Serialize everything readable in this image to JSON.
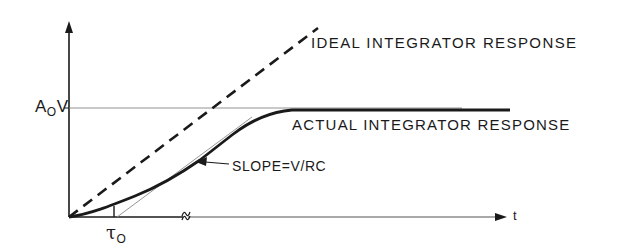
{
  "diagram": {
    "type": "integrator response time plot",
    "curves": {
      "ideal": {
        "label": "IDEAL INTEGRATOR RESPONSE",
        "style": "dashed"
      },
      "actual": {
        "label": "ACTUAL INTEGRATOR RESPONSE",
        "style": "solid"
      }
    },
    "annotations": {
      "slope": "SLOPE=V/RC",
      "saturation_level": {
        "main": "A",
        "sub": "O",
        "tail": "V"
      },
      "time_constant": {
        "main": "τ",
        "sub": "O"
      },
      "time_axis": "t"
    },
    "colors": {
      "ink": "#1a1a1a",
      "thin_line": "#555555",
      "background": "#ffffff"
    }
  }
}
